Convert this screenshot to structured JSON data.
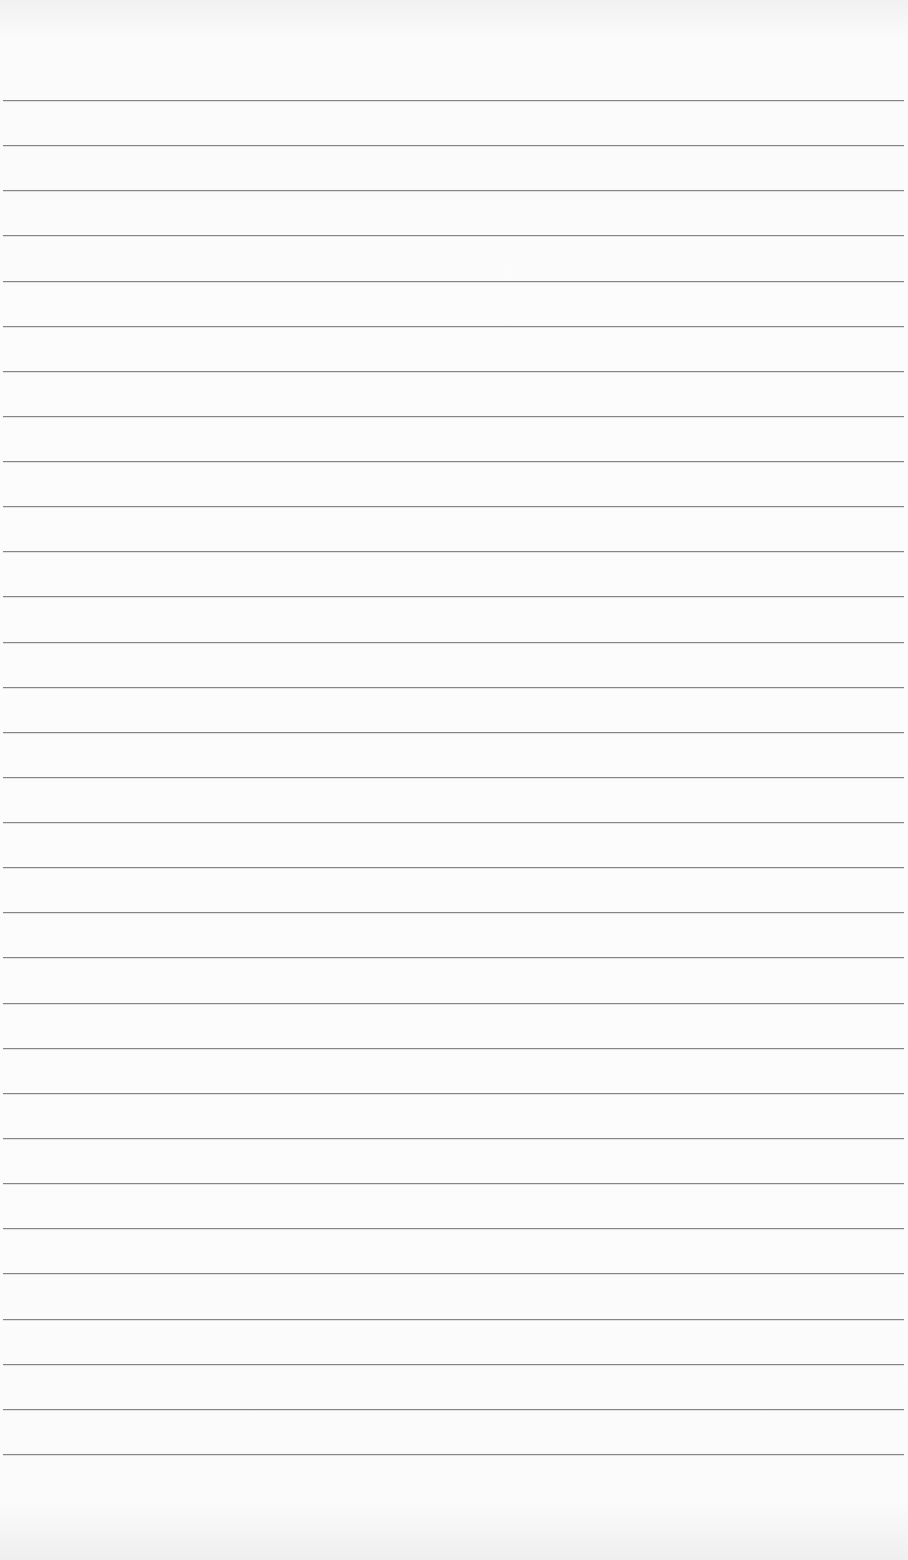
{
  "page": {
    "type": "ruled-paper",
    "background": "#fbfbfb",
    "line_color": "#858585",
    "line_count": 31,
    "first_line_y": 100,
    "line_spacing": 45.13,
    "line_left": 3,
    "line_right": 904
  }
}
